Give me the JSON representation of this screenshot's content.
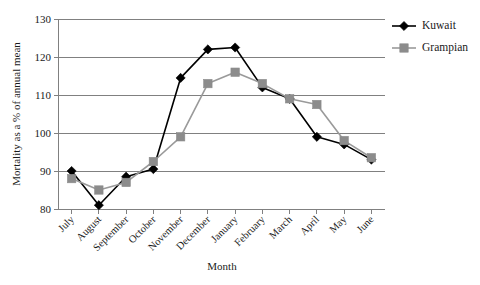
{
  "chart_data": {
    "type": "line",
    "title": "",
    "xlabel": "Month",
    "ylabel": "Mortality as a % of annual mean",
    "categories": [
      "July",
      "August",
      "September",
      "October",
      "November",
      "December",
      "January",
      "February",
      "March",
      "April",
      "May",
      "June"
    ],
    "series": [
      {
        "name": "Kuwait",
        "color": "#000000",
        "marker": "diamond",
        "values": [
          90,
          81,
          88.5,
          90.5,
          114.5,
          122,
          122.5,
          112,
          109,
          99,
          97,
          93
        ]
      },
      {
        "name": "Grampian",
        "color": "#8c8c8c",
        "marker": "square",
        "values": [
          88,
          85,
          87,
          92.5,
          99,
          113,
          116,
          113,
          109,
          107.5,
          98,
          93.5
        ]
      }
    ],
    "ylim": [
      80,
      130
    ],
    "yticks": [
      80,
      90,
      100,
      110,
      120,
      130
    ],
    "ytick_labels": [
      "80",
      "90",
      "100",
      "110",
      "120",
      "130"
    ],
    "grid": true,
    "legend_position": "right",
    "legend_entries": [
      "Kuwait",
      "Grampian"
    ]
  },
  "axes": {
    "y_title": "Mortality as a % of annual mean",
    "x_title": "Month"
  }
}
